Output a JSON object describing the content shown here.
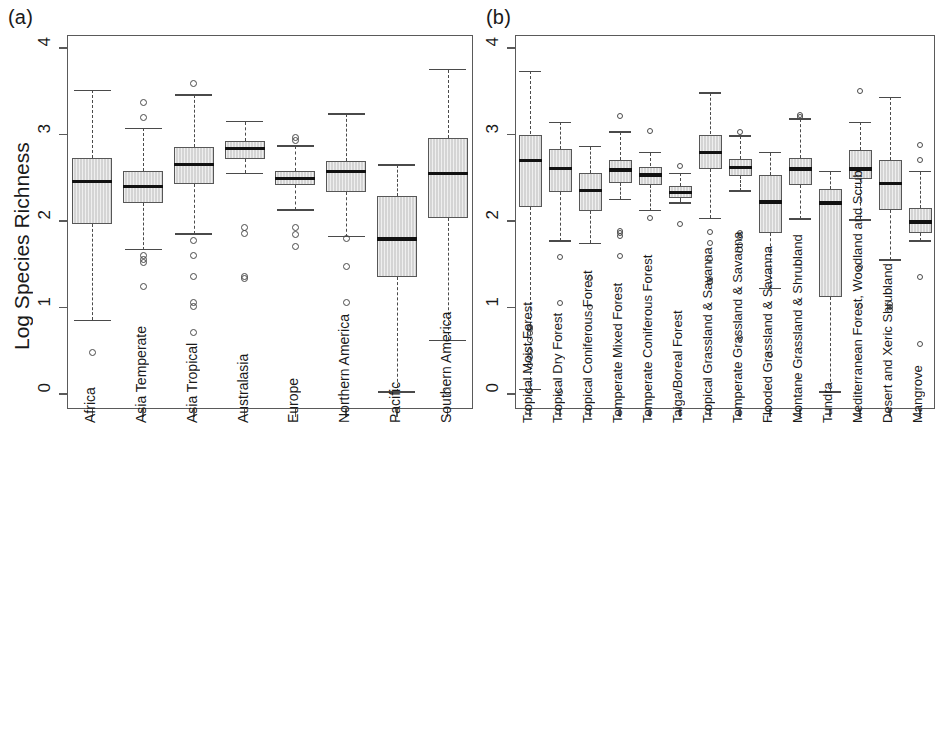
{
  "figure": {
    "panel_a_tag": "(a)",
    "panel_b_tag": "(b)",
    "ylabel": "Log Species Richness"
  },
  "chart_data": [
    {
      "type": "box",
      "panel": "(a)",
      "title": "",
      "xlabel": "",
      "ylabel": "Log Species Richness",
      "ylim": [
        0,
        4.1
      ],
      "yticks": [
        0,
        1,
        2,
        3,
        4
      ],
      "ytick_labels": [
        "0",
        "1",
        "2",
        "3",
        "4"
      ],
      "grid": false,
      "legend": "none",
      "categories": [
        "Africa",
        "Asia Temperate",
        "Asia Tropical",
        "Australasia",
        "Europe",
        "Northern America",
        "Pacific",
        "Southern America"
      ],
      "boxes": [
        {
          "label": "Africa",
          "whisker_low": 0.85,
          "q1": 1.96,
          "median": 2.46,
          "q3": 2.73,
          "whisker_high": 3.51,
          "outliers": [
            0.48
          ]
        },
        {
          "label": "Asia Temperate",
          "whisker_low": 1.67,
          "q1": 2.21,
          "median": 2.4,
          "q3": 2.58,
          "whisker_high": 3.07,
          "outliers": [
            3.37,
            3.2,
            1.6,
            1.56,
            1.52,
            1.24
          ]
        },
        {
          "label": "Asia Tropical",
          "whisker_low": 1.85,
          "q1": 2.43,
          "median": 2.65,
          "q3": 2.85,
          "whisker_high": 3.46,
          "outliers": [
            3.59,
            1.77,
            1.6,
            1.36,
            1.06,
            1.01,
            0.71
          ]
        },
        {
          "label": "Australasia",
          "whisker_low": 2.55,
          "q1": 2.72,
          "median": 2.84,
          "q3": 2.93,
          "whisker_high": 3.15,
          "outliers": [
            1.92,
            1.86,
            1.36,
            1.33
          ]
        },
        {
          "label": "Europe",
          "whisker_low": 2.13,
          "q1": 2.42,
          "median": 2.49,
          "q3": 2.58,
          "whisker_high": 2.87,
          "outliers": [
            2.96,
            2.93,
            1.93,
            1.84,
            1.7
          ]
        },
        {
          "label": "Northern America",
          "whisker_low": 1.82,
          "q1": 2.33,
          "median": 2.57,
          "q3": 2.69,
          "whisker_high": 3.24,
          "outliers": [
            1.8,
            1.47,
            1.06
          ]
        },
        {
          "label": "Pacific",
          "whisker_low": 0.02,
          "q1": 1.35,
          "median": 1.79,
          "q3": 2.29,
          "whisker_high": 2.65,
          "outliers": []
        },
        {
          "label": "Southern America",
          "whisker_low": 0.62,
          "q1": 2.03,
          "median": 2.55,
          "q3": 2.96,
          "whisker_high": 3.75,
          "outliers": [
            0.03
          ]
        }
      ]
    },
    {
      "type": "box",
      "panel": "(b)",
      "title": "",
      "xlabel": "",
      "ylabel": "",
      "ylim": [
        0,
        4.1
      ],
      "yticks": [
        0,
        1,
        2,
        3,
        4
      ],
      "ytick_labels": [
        "0",
        "1",
        "2",
        "3",
        "4"
      ],
      "grid": false,
      "legend": "none",
      "categories": [
        "Tropical Moist Forest",
        "Tropical Dry Forest",
        "Tropical Coniferous Forest",
        "Temperate Mixed Forest",
        "Temperate Coniferous Forest",
        "Taiga/Boreal Forest",
        "Tropical Grassland & Savanna",
        "Temperate Grassland & Savanna",
        "Flooded Grassland & Savanna",
        "Montane Grassland & Shrubland",
        "Tundra",
        "Mediterranean Forest, Woodland and Scrub",
        "Desert and Xeric Shrubland",
        "Mangrove"
      ],
      "boxes": [
        {
          "label": "Tropical Moist Forest",
          "whisker_low": 0.05,
          "q1": 2.16,
          "median": 2.7,
          "q3": 3.0,
          "whisker_high": 3.73,
          "outliers": [
            0.78,
            0.75,
            0.7,
            0.62,
            0.5,
            0.43,
            0.34,
            0.03
          ]
        },
        {
          "label": "Tropical Dry Forest",
          "whisker_low": 1.77,
          "q1": 2.33,
          "median": 2.61,
          "q3": 2.83,
          "whisker_high": 3.14,
          "outliers": [
            1.58,
            1.05,
            0.02
          ]
        },
        {
          "label": "Tropical Coniferous Forest",
          "whisker_low": 1.74,
          "q1": 2.12,
          "median": 2.35,
          "q3": 2.56,
          "whisker_high": 2.86,
          "outliers": [
            1.34,
            1.01
          ]
        },
        {
          "label": "Temperate Mixed Forest",
          "whisker_low": 2.25,
          "q1": 2.44,
          "median": 2.59,
          "q3": 2.7,
          "whisker_high": 3.03,
          "outliers": [
            3.21,
            1.89,
            1.86,
            1.83,
            1.59
          ]
        },
        {
          "label": "Temperate Coniferous Forest",
          "whisker_low": 2.12,
          "q1": 2.42,
          "median": 2.53,
          "q3": 2.63,
          "whisker_high": 2.79,
          "outliers": [
            3.04,
            2.03
          ]
        },
        {
          "label": "Taiga/Boreal Forest",
          "whisker_low": 2.21,
          "q1": 2.27,
          "median": 2.33,
          "q3": 2.41,
          "whisker_high": 2.55,
          "outliers": [
            2.64,
            1.97
          ]
        },
        {
          "label": "Tropical Grassland & Savanna",
          "whisker_low": 2.03,
          "q1": 2.6,
          "median": 2.79,
          "q3": 3.0,
          "whisker_high": 3.48,
          "outliers": [
            1.87,
            1.75,
            1.56,
            1.33,
            1.3
          ]
        },
        {
          "label": "Temperate Grassland & Savanna",
          "whisker_low": 2.35,
          "q1": 2.52,
          "median": 2.62,
          "q3": 2.72,
          "whisker_high": 2.98,
          "outliers": [
            3.03,
            1.86,
            1.82,
            1.72,
            1.66,
            0.65
          ]
        },
        {
          "label": "Flooded Grassland & Savanna",
          "whisker_low": 1.22,
          "q1": 1.86,
          "median": 2.22,
          "q3": 2.53,
          "whisker_high": 2.79,
          "outliers": [
            0.45
          ]
        },
        {
          "label": "Montane Grassland & Shrubland",
          "whisker_low": 2.02,
          "q1": 2.42,
          "median": 2.6,
          "q3": 2.73,
          "whisker_high": 3.18,
          "outliers": [
            3.22,
            3.2
          ]
        },
        {
          "label": "Tundra",
          "whisker_low": 0.02,
          "q1": 1.12,
          "median": 2.21,
          "q3": 2.37,
          "whisker_high": 2.57,
          "outliers": []
        },
        {
          "label": "Mediterranean Forest, Woodland and Scrub",
          "whisker_low": 2.01,
          "q1": 2.48,
          "median": 2.6,
          "q3": 2.82,
          "whisker_high": 3.14,
          "outliers": [
            3.5,
            1.47,
            1.02
          ]
        },
        {
          "label": "Desert and Xeric Shrubland",
          "whisker_low": 1.55,
          "q1": 2.13,
          "median": 2.43,
          "q3": 2.7,
          "whisker_high": 3.43,
          "outliers": [
            1.04,
            1.01,
            0.97
          ]
        },
        {
          "label": "Mangrove",
          "whisker_low": 1.77,
          "q1": 1.86,
          "median": 1.99,
          "q3": 2.15,
          "whisker_high": 2.57,
          "outliers": [
            2.88,
            2.7,
            1.35,
            0.58
          ]
        }
      ]
    }
  ]
}
